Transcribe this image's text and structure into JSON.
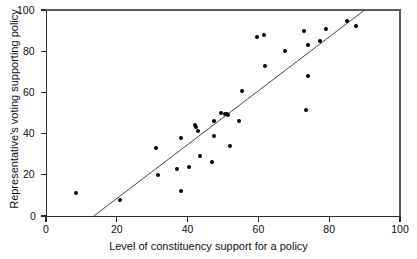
{
  "chart_data": {
    "type": "scatter",
    "title": "",
    "xlabel": "Level of constituency support for a policy",
    "ylabel": "Representative's voting supporting policy",
    "xlim": [
      0,
      100
    ],
    "ylim": [
      0,
      100
    ],
    "xticks": [
      0,
      20,
      40,
      60,
      80,
      100
    ],
    "yticks": [
      0,
      20,
      40,
      60,
      80,
      100
    ],
    "grid": false,
    "legend": "none",
    "marker": {
      "shape": "circle",
      "color": "#000000",
      "size": 4
    },
    "points": [
      {
        "x": 8.5,
        "y": 11
      },
      {
        "x": 21,
        "y": 8
      },
      {
        "x": 31,
        "y": 33
      },
      {
        "x": 31.5,
        "y": 20
      },
      {
        "x": 37,
        "y": 23
      },
      {
        "x": 38,
        "y": 38
      },
      {
        "x": 38,
        "y": 12
      },
      {
        "x": 40.5,
        "y": 24
      },
      {
        "x": 42,
        "y": 44
      },
      {
        "x": 42.5,
        "y": 43
      },
      {
        "x": 43,
        "y": 41.5
      },
      {
        "x": 43.5,
        "y": 29
      },
      {
        "x": 47,
        "y": 26
      },
      {
        "x": 47.5,
        "y": 39
      },
      {
        "x": 47.5,
        "y": 46
      },
      {
        "x": 49.5,
        "y": 50
      },
      {
        "x": 50.5,
        "y": 49.5
      },
      {
        "x": 51,
        "y": 49.5
      },
      {
        "x": 51.5,
        "y": 49
      },
      {
        "x": 52,
        "y": 34
      },
      {
        "x": 54.5,
        "y": 46
      },
      {
        "x": 55.5,
        "y": 60.5
      },
      {
        "x": 59.5,
        "y": 87
      },
      {
        "x": 61.5,
        "y": 88
      },
      {
        "x": 62,
        "y": 73
      },
      {
        "x": 67.5,
        "y": 80
      },
      {
        "x": 73,
        "y": 90
      },
      {
        "x": 73.5,
        "y": 51.5
      },
      {
        "x": 74,
        "y": 83
      },
      {
        "x": 74,
        "y": 68
      },
      {
        "x": 77.5,
        "y": 85
      },
      {
        "x": 79,
        "y": 91
      },
      {
        "x": 85,
        "y": 94.5
      },
      {
        "x": 87.5,
        "y": 92
      }
    ],
    "trendline": {
      "type": "linear-fit",
      "x_start": 13.5,
      "y_start": 0,
      "x_end": 90,
      "y_end": 100,
      "color": "#4a4a4a"
    }
  },
  "axes": {
    "x_tick_labels": [
      "0",
      "20",
      "40",
      "60",
      "80",
      "100"
    ],
    "y_tick_labels": [
      "0",
      "20",
      "40",
      "60",
      "80",
      "100"
    ]
  }
}
